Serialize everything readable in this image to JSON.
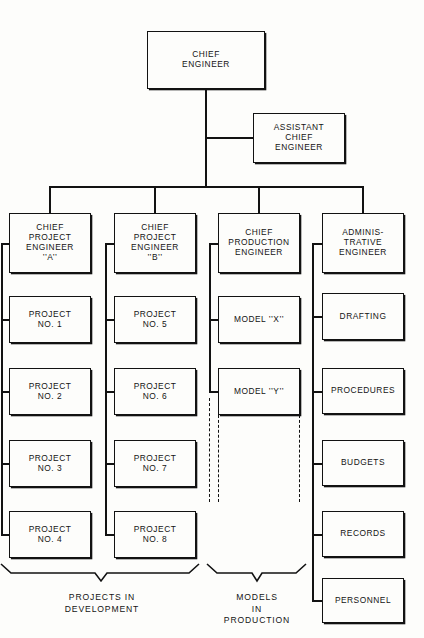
{
  "diagram": {
    "type": "organizational-chart",
    "colors": {
      "background": "#fdfdfb",
      "line": "#121212",
      "text": "#141414"
    }
  },
  "nodes": {
    "chief_engineer": "CHIEF\nENGINEER",
    "assistant_chief_engineer": "ASSISTANT\nCHIEF\nENGINEER",
    "chief_project_engineer_a": "CHIEF\nPROJECT\nENGINEER\n’’A’’",
    "chief_project_engineer_b": "CHIEF\nPROJECT\nENGINEER\n’’B’’",
    "chief_production_engineer": "CHIEF\nPRODUCTION\nENGINEER",
    "administrative_engineer": "ADMINIS-\nTRATIVE\nENGINEER",
    "project_1": "PROJECT\nNO. 1",
    "project_2": "PROJECT\nNO. 2",
    "project_3": "PROJECT\nNO. 3",
    "project_4": "PROJECT\nNO. 4",
    "project_5": "PROJECT\nNO. 5",
    "project_6": "PROJECT\nNO. 6",
    "project_7": "PROJECT\nNO. 7",
    "project_8": "PROJECT\nNO. 8",
    "model_x": "MODEL ’’X’’",
    "model_y": "MODEL ’’Y’’",
    "drafting": "DRAFTING",
    "procedures": "PROCEDURES",
    "budgets": "BUDGETS",
    "records": "RECORDS",
    "personnel": "PERSONNEL"
  },
  "group_captions": {
    "projects_in_development": "PROJECTS IN\nDEVELOPMENT",
    "models_in_production": "MODELS\nIN\nPRODUCTION"
  }
}
